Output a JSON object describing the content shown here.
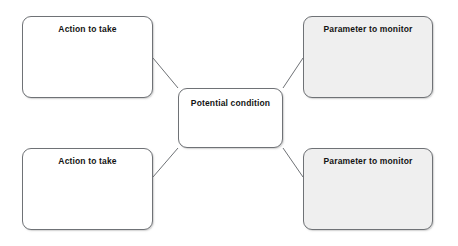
{
  "diagram": {
    "type": "radial-concept-map",
    "center": {
      "id": "potential-condition",
      "label": "Potential condition",
      "fill": "#ffffff",
      "border": "#6f7276"
    },
    "nodes": [
      {
        "id": "action-to-take-top",
        "label": "Action to take",
        "position": "top-left",
        "fill": "#ffffff",
        "border": "#6f7276"
      },
      {
        "id": "parameter-to-monitor-top",
        "label": "Parameter to monitor",
        "position": "top-right",
        "fill": "#efefef",
        "border": "#6f7276"
      },
      {
        "id": "action-to-take-bottom",
        "label": "Action to take",
        "position": "bottom-left",
        "fill": "#ffffff",
        "border": "#6f7276"
      },
      {
        "id": "parameter-to-monitor-bottom",
        "label": "Parameter to monitor",
        "position": "bottom-right",
        "fill": "#efefef",
        "border": "#6f7276"
      }
    ],
    "connectors": [
      {
        "id": "connector-top-left",
        "from": "action-to-take-top",
        "to": "potential-condition",
        "color": "#6f7276"
      },
      {
        "id": "connector-top-right",
        "from": "parameter-to-monitor-top",
        "to": "potential-condition",
        "color": "#6f7276"
      },
      {
        "id": "connector-bottom-left",
        "from": "action-to-take-bottom",
        "to": "potential-condition",
        "color": "#6f7276"
      },
      {
        "id": "connector-bottom-right",
        "from": "parameter-to-monitor-bottom",
        "to": "potential-condition",
        "color": "#6f7276"
      }
    ]
  }
}
